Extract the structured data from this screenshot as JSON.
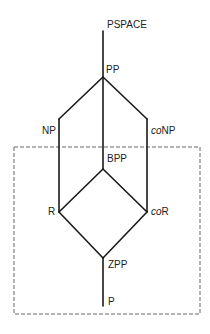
{
  "diagram": {
    "colors": {
      "line": "#1a1a1a",
      "dashed": "#555555",
      "text": "#222222",
      "background": "#ffffff"
    },
    "nodes": [
      {
        "id": "PSPACE",
        "label": "PSPACE",
        "prefix_italic": "",
        "suffix": "PSPACE"
      },
      {
        "id": "PP",
        "label": "PP",
        "prefix_italic": "",
        "suffix": "PP"
      },
      {
        "id": "NP",
        "label": "NP",
        "prefix_italic": "",
        "suffix": "NP"
      },
      {
        "id": "coNP",
        "label": "coNP",
        "prefix_italic": "co",
        "suffix": "NP"
      },
      {
        "id": "BPP",
        "label": "BPP",
        "prefix_italic": "",
        "suffix": "BPP"
      },
      {
        "id": "R",
        "label": "R",
        "prefix_italic": "",
        "suffix": "R"
      },
      {
        "id": "coR",
        "label": "coR",
        "prefix_italic": "co",
        "suffix": "R"
      },
      {
        "id": "ZPP",
        "label": "ZPP",
        "prefix_italic": "",
        "suffix": "ZPP"
      },
      {
        "id": "P",
        "label": "P",
        "prefix_italic": "",
        "suffix": "P"
      }
    ],
    "edges": [
      [
        "PSPACE",
        "PP"
      ],
      [
        "PP",
        "NP"
      ],
      [
        "PP",
        "coNP"
      ],
      [
        "PP",
        "BPP"
      ],
      [
        "NP",
        "R"
      ],
      [
        "coNP",
        "coR"
      ],
      [
        "BPP",
        "R"
      ],
      [
        "BPP",
        "coR"
      ],
      [
        "R",
        "ZPP"
      ],
      [
        "coR",
        "ZPP"
      ],
      [
        "ZPP",
        "P"
      ]
    ],
    "dashed_region": {
      "description": "probabilistic classes box"
    }
  }
}
